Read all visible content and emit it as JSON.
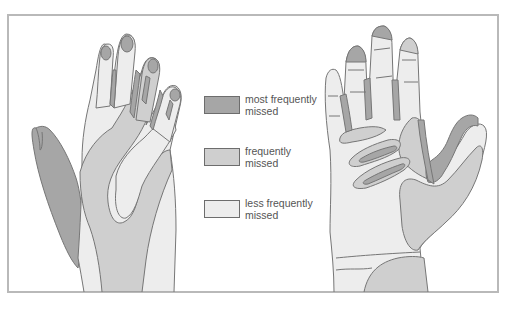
{
  "figure": {
    "title": ""
  },
  "colors": {
    "most_frequently_missed": "#a6a6a6",
    "frequently_missed": "#cfcfcf",
    "less_frequently_missed": "#ededed",
    "outline": "#767676",
    "frame": "#b9b9b9"
  },
  "legend": {
    "items": [
      {
        "key": "most_frequently_missed",
        "line1": "most frequently",
        "line2": "missed",
        "color": "#a6a6a6"
      },
      {
        "key": "frequently_missed",
        "line1": "frequently",
        "line2": "missed",
        "color": "#cfcfcf"
      },
      {
        "key": "less_frequently_missed",
        "line1": "less frequently",
        "line2": "missed",
        "color": "#ededed"
      }
    ]
  },
  "views": [
    {
      "name": "back-of-hand",
      "side": "left"
    },
    {
      "name": "palm-of-hand",
      "side": "right"
    }
  ]
}
